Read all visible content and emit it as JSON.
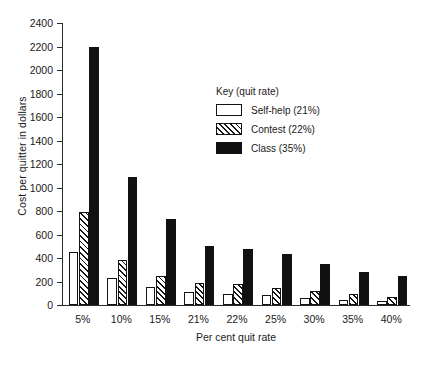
{
  "chart_data": {
    "type": "bar",
    "title": "",
    "xlabel": "Per cent quit rate",
    "ylabel": "Cost per quitter in dollars",
    "ylim": [
      0,
      2400
    ],
    "ytick_step": 200,
    "yticks": [
      0,
      200,
      400,
      600,
      800,
      1000,
      1200,
      1400,
      1600,
      1800,
      2000,
      2200,
      2400
    ],
    "grid": false,
    "legend_position": "inside-upper-right",
    "legend_title": "Key (quit rate)",
    "categories": [
      "5%",
      "10%",
      "15%",
      "21%",
      "22%",
      "25%",
      "30%",
      "35%",
      "40%"
    ],
    "series": [
      {
        "name": "Self-help (21%)",
        "fill": "white-outline",
        "values": [
          450,
          230,
          150,
          110,
          95,
          85,
          60,
          45,
          30
        ]
      },
      {
        "name": "Contest (22%)",
        "fill": "diagonal-hatch",
        "values": [
          790,
          385,
          250,
          185,
          180,
          145,
          120,
          90,
          70
        ]
      },
      {
        "name": "Class (35%)",
        "fill": "solid-black",
        "values": [
          2200,
          1090,
          730,
          500,
          480,
          430,
          345,
          285,
          250
        ]
      }
    ]
  },
  "legend": {
    "title": "Key (quit rate)",
    "entries": [
      {
        "label": "Self-help (21%)",
        "swatch": "white-outline"
      },
      {
        "label": "Contest (22%)",
        "swatch": "diagonal-hatch"
      },
      {
        "label": "Class (35%)",
        "swatch": "solid-black"
      }
    ]
  },
  "caption": "",
  "colors": {
    "ink": "#141414",
    "axis": "#2b2b2b",
    "background": "#ffffff"
  }
}
